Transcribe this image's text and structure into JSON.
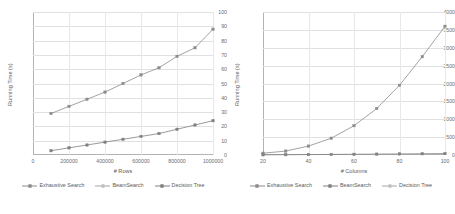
{
  "figure": {
    "panels": [
      {
        "id": "rows-panel",
        "axis": {
          "ylabel": "Running Time (s)",
          "xlabel": "# Rows",
          "yticks": [
            "0",
            "10",
            "20",
            "30",
            "40",
            "50",
            "60",
            "70",
            "80",
            "90",
            "100"
          ],
          "xticks": [
            "0",
            "200000",
            "400000",
            "600000",
            "800000",
            "1000000"
          ]
        },
        "legend": [
          {
            "label": "Exhaustive Search",
            "marker": "square",
            "color": "#8c8c8c"
          },
          {
            "label": "BeamSearch",
            "marker": "square-hollow",
            "color": "#a6a6a6"
          },
          {
            "label": "Decision Tree",
            "marker": "square",
            "color": "#808080"
          }
        ]
      },
      {
        "id": "columns-panel",
        "axis": {
          "ylabel": "Running Time (s)",
          "xlabel": "# Columns",
          "yticks": [
            "0",
            "500",
            "1000",
            "1500",
            "2000",
            "2500",
            "3000",
            "3500",
            "4000"
          ],
          "xticks": [
            "20",
            "40",
            "60",
            "80",
            "100"
          ]
        },
        "legend": [
          {
            "label": "Exhaustive Search",
            "marker": "square",
            "color": "#8c8c8c"
          },
          {
            "label": "BeamSearch",
            "marker": "square",
            "color": "#808080"
          },
          {
            "label": "Decision Tree",
            "marker": "square-hollow",
            "color": "#a6a6a6"
          }
        ]
      }
    ]
  },
  "chart_data": [
    {
      "type": "line",
      "title": "",
      "xlabel": "# Rows",
      "ylabel": "Running Time (s)",
      "xlim": [
        0,
        1000000
      ],
      "ylim": [
        0,
        100
      ],
      "xticks": [
        0,
        200000,
        400000,
        600000,
        800000,
        1000000
      ],
      "yticks": [
        0,
        10,
        20,
        30,
        40,
        50,
        60,
        70,
        80,
        90,
        100
      ],
      "grid": true,
      "legend_position": "bottom",
      "x": [
        100000,
        200000,
        300000,
        400000,
        500000,
        600000,
        700000,
        800000,
        900000,
        1000000
      ],
      "series": [
        {
          "name": "Exhaustive Search",
          "values": [
            29,
            34,
            39,
            44,
            50,
            56,
            61,
            69,
            75,
            88
          ],
          "color": "#8c8c8c",
          "marker": "square"
        },
        {
          "name": "BeamSearch",
          "values": [
            3,
            5,
            7,
            9,
            11,
            13,
            15,
            18,
            21,
            24
          ],
          "color": "#808080",
          "marker": "square"
        },
        {
          "name": "Decision Tree",
          "values": [],
          "color": "#a6a6a6",
          "marker": "square-hollow",
          "note": "not visible in plot area"
        }
      ]
    },
    {
      "type": "line",
      "title": "",
      "xlabel": "# Columns",
      "ylabel": "Running Time (s)",
      "xlim": [
        20,
        100
      ],
      "ylim": [
        0,
        4000
      ],
      "xticks": [
        20,
        40,
        60,
        80,
        100
      ],
      "yticks": [
        0,
        500,
        1000,
        1500,
        2000,
        2500,
        3000,
        3500,
        4000
      ],
      "grid": true,
      "legend_position": "bottom",
      "x": [
        20,
        30,
        40,
        50,
        60,
        70,
        80,
        90,
        100
      ],
      "series": [
        {
          "name": "Exhaustive Search",
          "values": [
            50,
            110,
            250,
            470,
            820,
            1300,
            1950,
            2750,
            3600
          ],
          "color": "#8c8c8c",
          "marker": "square"
        },
        {
          "name": "BeamSearch",
          "values": [
            5,
            8,
            12,
            16,
            20,
            25,
            30,
            35,
            40
          ],
          "color": "#808080",
          "marker": "square"
        },
        {
          "name": "Decision Tree",
          "values": [],
          "color": "#a6a6a6",
          "marker": "square-hollow",
          "note": "not visible in plot area"
        }
      ]
    }
  ]
}
